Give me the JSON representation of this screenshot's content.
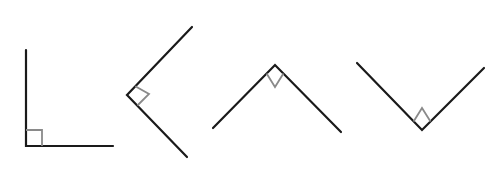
{
  "diagram": {
    "colors": {
      "line": "#1a1a1a",
      "marker": "#8a8a8a",
      "background": "#ffffff"
    },
    "angles": [
      {
        "name": "right-angle-L",
        "vertex": [
          26,
          146
        ],
        "arm1": [
          26,
          50
        ],
        "arm2": [
          113,
          146
        ],
        "marker": "16x16 square"
      },
      {
        "name": "right-angle-left-pointing",
        "vertex": [
          127,
          95
        ],
        "arm1": [
          192,
          27
        ],
        "arm2": [
          187,
          157
        ],
        "marker": "rotated square"
      },
      {
        "name": "right-angle-up-pointing",
        "vertex": [
          275,
          65
        ],
        "arm1": [
          213,
          128
        ],
        "arm2": [
          341,
          132
        ],
        "marker": "rotated square"
      },
      {
        "name": "right-angle-down-pointing",
        "vertex": [
          422,
          130
        ],
        "arm1": [
          357,
          63
        ],
        "arm2": [
          484,
          68
        ],
        "marker": "rotated square"
      }
    ]
  }
}
